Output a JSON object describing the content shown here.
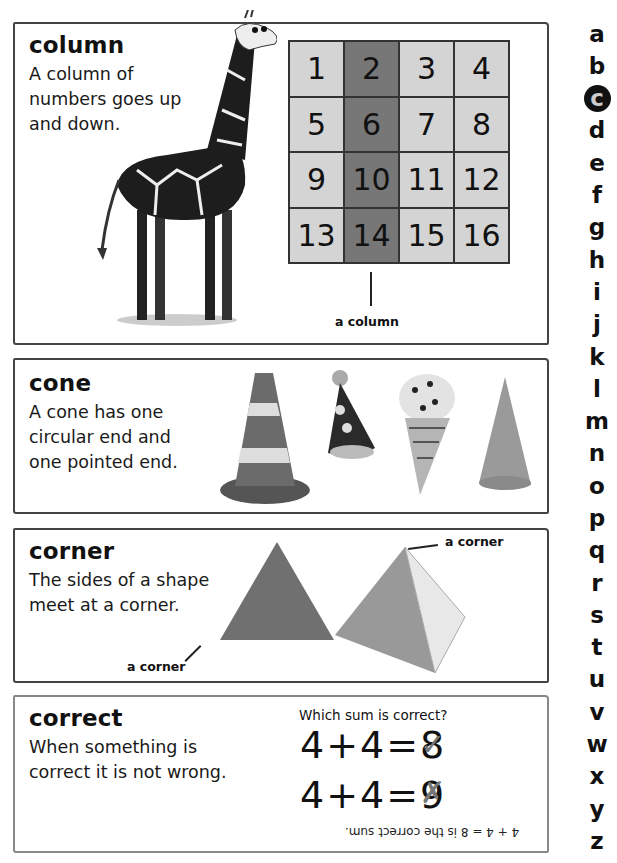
{
  "entries": [
    {
      "word": "column",
      "definition": "A column of\nnumbers goes up\nand down.",
      "illustration": "giraffe",
      "grid": {
        "rows": [
          [
            "1",
            "2",
            "3",
            "4"
          ],
          [
            "5",
            "6",
            "7",
            "8"
          ],
          [
            "9",
            "10",
            "11",
            "12"
          ],
          [
            "13",
            "14",
            "15",
            "16"
          ]
        ],
        "highlighted_column_index": 1,
        "label": "a column"
      }
    },
    {
      "word": "cone",
      "definition": "A cone has one\ncircular end and\none pointed end.",
      "illustrations": [
        "traffic-cone",
        "party-hat",
        "ice-cream-cone",
        "plain-cone"
      ]
    },
    {
      "word": "corner",
      "definition": "The sides of a shape\nmeet at a corner.",
      "illustrations": [
        "triangle",
        "pyramid"
      ],
      "labels": [
        "a corner",
        "a corner"
      ]
    },
    {
      "word": "correct",
      "definition": "When something is\ncorrect it is not wrong.",
      "question": "Which sum is correct?",
      "sums": [
        {
          "text": "4+4=8",
          "mark": "✓"
        },
        {
          "text": "4+4=9",
          "mark": "✗"
        }
      ],
      "answer_upside_down": "4 + 4 = 8 is the correct sum."
    }
  ],
  "alphabet": {
    "letters": [
      "a",
      "b",
      "c",
      "d",
      "e",
      "f",
      "g",
      "h",
      "i",
      "j",
      "k",
      "l",
      "m",
      "n",
      "o",
      "p",
      "q",
      "r",
      "s",
      "t",
      "u",
      "v",
      "w",
      "x",
      "y",
      "z"
    ],
    "active": "c"
  },
  "colors": {
    "grid_cell": "#d4d4d4",
    "grid_highlight": "#777777",
    "border": "#444444",
    "text": "#111111"
  }
}
